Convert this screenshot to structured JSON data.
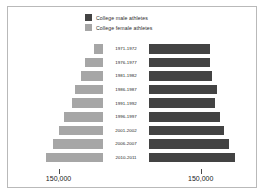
{
  "legend": {
    "items": [
      {
        "label": "College male athletes",
        "color": "#434343",
        "key": "male"
      },
      {
        "label": "College female athletes",
        "color": "#a6a6a6",
        "key": "female"
      }
    ]
  },
  "axis": {
    "left_tick_label": "150,000",
    "right_tick_label": "150,000"
  },
  "chart_data": {
    "type": "bar",
    "title": "",
    "subtype": "population-pyramid",
    "orientation": "horizontal-diverging",
    "xlabel": "",
    "ylabel": "",
    "grid": false,
    "legend_position": "top-center",
    "tick_values": [
      150000,
      150000
    ],
    "axis_max": 290000,
    "categories": [
      "1971-1972",
      "1976-1977",
      "1981-1982",
      "1986-1987",
      "1991-1992",
      "1996-1997",
      "2001-2002",
      "2006-2007",
      "2010-2011"
    ],
    "series": [
      {
        "name": "College female athletes",
        "color": "#a6a6a6",
        "direction": "left",
        "values": [
          30000,
          62000,
          74000,
          93000,
          105000,
          130000,
          150000,
          168000,
          193000
        ]
      },
      {
        "name": "College male athletes",
        "color": "#434343",
        "direction": "right",
        "values": [
          178000,
          176000,
          182000,
          196000,
          192000,
          206000,
          218000,
          232000,
          250000
        ]
      }
    ]
  }
}
